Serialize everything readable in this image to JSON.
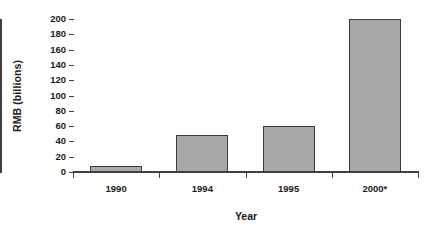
{
  "chart_data": {
    "type": "bar",
    "title": "",
    "xlabel": "Year",
    "ylabel": "RMB (billions)",
    "categories": [
      "1990",
      "1994",
      "1995",
      "2000*"
    ],
    "values": [
      8,
      49,
      60,
      200
    ],
    "ylim": [
      0,
      200
    ],
    "yticks": [
      0,
      20,
      40,
      60,
      80,
      100,
      120,
      140,
      160,
      180,
      200
    ],
    "ytick_labels": [
      "0",
      "20",
      "40",
      "60",
      "80",
      "100",
      "120",
      "140",
      "160",
      "180",
      "200"
    ],
    "grid": false,
    "legend": null,
    "series": [
      {
        "name": "RMB (billions)",
        "values": [
          8,
          49,
          60,
          200
        ],
        "fill_color": "#a8a8a8",
        "border_color": "#3d3d3d"
      }
    ],
    "annotations": []
  },
  "axes": {
    "y_title": "RMB (billions)",
    "x_title": "Year"
  }
}
